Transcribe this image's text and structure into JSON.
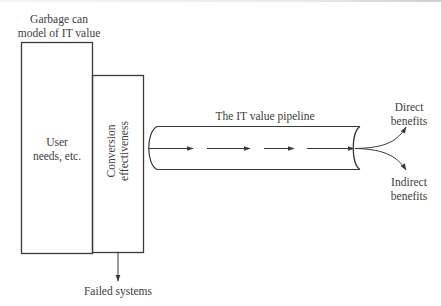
{
  "diagram": {
    "title_label": [
      "Garbage can",
      "model of IT value"
    ],
    "user_box_label": [
      "User",
      "needs, etc."
    ],
    "conversion_box_label": [
      "Conversion",
      "effectiveness"
    ],
    "failed_label": "Failed systems",
    "pipeline_label": "The IT value pipeline",
    "direct_label": [
      "Direct",
      "benefits"
    ],
    "indirect_label": [
      "Indirect",
      "benefits"
    ],
    "stroke_color": "#3a3a3a",
    "background_color": "#ffffff"
  }
}
